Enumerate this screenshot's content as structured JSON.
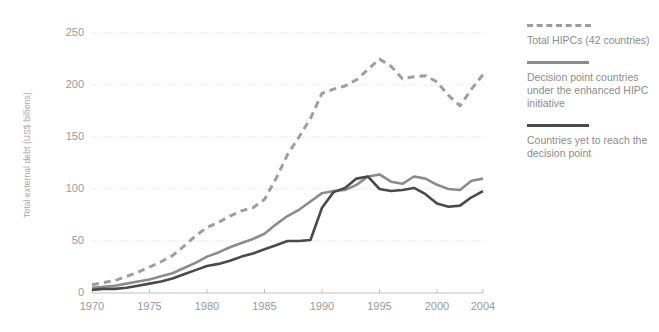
{
  "chart_data": {
    "type": "line",
    "title": "",
    "xlabel": "",
    "ylabel": "Total external debt (US$ billions)",
    "xlim": [
      1970,
      2004
    ],
    "ylim": [
      0,
      250
    ],
    "yticks": [
      0,
      50,
      100,
      150,
      200,
      250
    ],
    "xticks": [
      1970,
      1975,
      1980,
      1985,
      1990,
      1995,
      2000,
      2004
    ],
    "grid": true,
    "legend_position": "right",
    "x": [
      1970,
      1971,
      1972,
      1973,
      1974,
      1975,
      1976,
      1977,
      1978,
      1979,
      1980,
      1981,
      1982,
      1983,
      1984,
      1985,
      1986,
      1987,
      1988,
      1989,
      1990,
      1991,
      1992,
      1993,
      1994,
      1995,
      1996,
      1997,
      1998,
      1999,
      2000,
      2001,
      2002,
      2003,
      2004
    ],
    "series": [
      {
        "name": "Total HIPCs (42 countries)",
        "style": "dashed",
        "color": "#9e9e9e",
        "values": [
          8,
          10,
          12,
          16,
          20,
          25,
          30,
          36,
          45,
          55,
          63,
          68,
          74,
          79,
          82,
          90,
          110,
          133,
          150,
          168,
          192,
          196,
          199,
          205,
          215,
          225,
          218,
          206,
          208,
          209,
          203,
          190,
          180,
          196,
          210
        ]
      },
      {
        "name": "Decision point countries under the enhanced HIPC initiative",
        "style": "solid",
        "color": "#8c8c8c",
        "values": [
          5,
          6,
          7,
          9,
          11,
          13,
          16,
          19,
          24,
          29,
          35,
          39,
          44,
          48,
          52,
          57,
          66,
          74,
          80,
          88,
          96,
          98,
          99,
          104,
          112,
          114,
          107,
          105,
          112,
          110,
          104,
          100,
          99,
          108,
          110
        ]
      },
      {
        "name": "Countries yet to reach the decision point",
        "style": "solid",
        "color": "#4a4a4a",
        "values": [
          3,
          4,
          4,
          5,
          7,
          9,
          11,
          14,
          18,
          22,
          26,
          28,
          31,
          35,
          38,
          42,
          46,
          50,
          50,
          51,
          82,
          97,
          101,
          110,
          112,
          100,
          98,
          99,
          101,
          95,
          86,
          83,
          84,
          92,
          98
        ]
      }
    ]
  },
  "legend": {
    "entries": [
      {
        "label": "Total HIPCs (42 countries)"
      },
      {
        "label": "Decision point countries under the enhanced HIPC initiative"
      },
      {
        "label": "Countries yet to reach the decision point"
      }
    ]
  }
}
